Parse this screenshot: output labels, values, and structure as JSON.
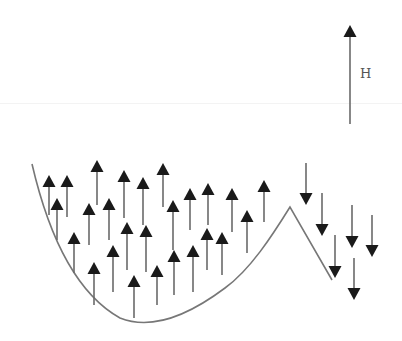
{
  "figure": {
    "type": "magnetic domain / field diagram",
    "field_label": "H",
    "colors": {
      "arrow": "#1a1a1a",
      "shaft": "#6a6a6a",
      "curve": "#777777",
      "background": "#ffffff"
    }
  },
  "field_arrow": {
    "x": 350,
    "y_tip": 25,
    "y_tail": 124,
    "direction": "up"
  },
  "boundary_curve": {
    "description": "U-shaped well on the left rising to a peak, then a straight line descending to the right",
    "path": "M 32 164 C 45 220, 70 290, 120 318 C 150 330, 185 318, 225 288 C 250 270, 272 236, 290 207 L 332 280"
  },
  "up_arrows": [
    {
      "x": 49,
      "y1": 175,
      "y2": 215
    },
    {
      "x": 67,
      "y1": 175,
      "y2": 217
    },
    {
      "x": 97,
      "y1": 160,
      "y2": 205
    },
    {
      "x": 124,
      "y1": 170,
      "y2": 218
    },
    {
      "x": 143,
      "y1": 177,
      "y2": 225
    },
    {
      "x": 163,
      "y1": 163,
      "y2": 207
    },
    {
      "x": 57,
      "y1": 198,
      "y2": 240
    },
    {
      "x": 89,
      "y1": 203,
      "y2": 245
    },
    {
      "x": 109,
      "y1": 198,
      "y2": 240
    },
    {
      "x": 173,
      "y1": 200,
      "y2": 250
    },
    {
      "x": 190,
      "y1": 188,
      "y2": 230
    },
    {
      "x": 208,
      "y1": 183,
      "y2": 225
    },
    {
      "x": 232,
      "y1": 188,
      "y2": 232
    },
    {
      "x": 264,
      "y1": 180,
      "y2": 222
    },
    {
      "x": 74,
      "y1": 232,
      "y2": 273
    },
    {
      "x": 127,
      "y1": 222,
      "y2": 270
    },
    {
      "x": 146,
      "y1": 225,
      "y2": 272
    },
    {
      "x": 207,
      "y1": 228,
      "y2": 270
    },
    {
      "x": 222,
      "y1": 232,
      "y2": 275
    },
    {
      "x": 247,
      "y1": 210,
      "y2": 253
    },
    {
      "x": 94,
      "y1": 262,
      "y2": 305
    },
    {
      "x": 113,
      "y1": 245,
      "y2": 292
    },
    {
      "x": 134,
      "y1": 275,
      "y2": 318
    },
    {
      "x": 157,
      "y1": 265,
      "y2": 305
    },
    {
      "x": 174,
      "y1": 250,
      "y2": 295
    },
    {
      "x": 193,
      "y1": 245,
      "y2": 292
    }
  ],
  "down_arrows": [
    {
      "x": 306,
      "y1": 163,
      "y2": 205
    },
    {
      "x": 322,
      "y1": 193,
      "y2": 236
    },
    {
      "x": 352,
      "y1": 205,
      "y2": 248
    },
    {
      "x": 372,
      "y1": 215,
      "y2": 257
    },
    {
      "x": 335,
      "y1": 235,
      "y2": 278
    },
    {
      "x": 354,
      "y1": 258,
      "y2": 300
    }
  ]
}
